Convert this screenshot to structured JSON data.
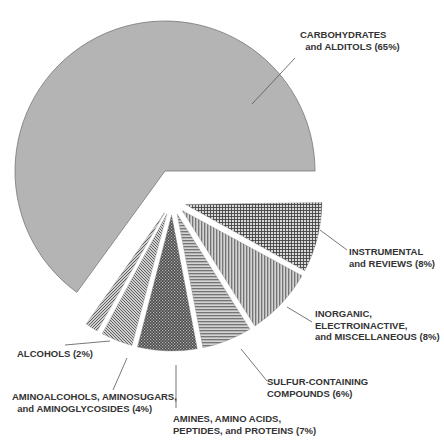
{
  "chart_data": {
    "type": "pie",
    "title": "",
    "exploded": true,
    "slices": [
      {
        "label": "CARBOHYDRATES\n  and ALDITOLS (65%)",
        "name": "Carbohydrates and Alditols",
        "value": 65,
        "pattern": "solid",
        "color": "#b4b4b4"
      },
      {
        "label": "INSTRUMENTAL\nand REVIEWS (8%)",
        "name": "Instrumental and Reviews",
        "value": 8,
        "pattern": "grid",
        "color": "#8a8a8a"
      },
      {
        "label": "INORGANIC,\nELECTROINACTIVE,\nand MISCELLANEOUS (8%)",
        "name": "Inorganic, Electroinactive, and Miscellaneous",
        "value": 8,
        "pattern": "vertical",
        "color": "#8a8a8a"
      },
      {
        "label": "SULFUR-CONTAINING\nCOMPOUNDS (6%)",
        "name": "Sulfur-Containing Compounds",
        "value": 6,
        "pattern": "horizontal",
        "color": "#8a8a8a"
      },
      {
        "label": "AMINES, AMINO ACIDS,\nPEPTIDES, and PROTEINS (7%)",
        "name": "Amines, Amino Acids, Peptides, and Proteins",
        "value": 7,
        "pattern": "dots",
        "color": "#5a5a5a"
      },
      {
        "label": "AMINOALCOHOLS, AMINOSUGARS,\n  and AMINOGLYCOSIDES (4%)",
        "name": "Aminoalcohols, Aminosugars, and Aminoglycosides",
        "value": 4,
        "pattern": "diag-back",
        "color": "#8a8a8a"
      },
      {
        "label": "ALCOHOLS (2%)",
        "name": "Alcohols",
        "value": 2,
        "pattern": "diag-fwd",
        "color": "#8a8a8a"
      }
    ],
    "legend": "none",
    "labels_position": "outside with leader lines"
  }
}
